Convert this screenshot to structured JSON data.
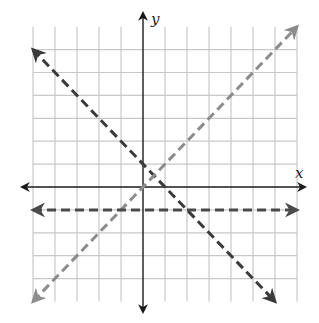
{
  "canvas": {
    "width": 319,
    "height": 323,
    "background": "#ffffff"
  },
  "frame": {
    "origin_px": [
      143,
      187
    ],
    "unit_x_px": 22.0,
    "unit_y_px": 22.9
  },
  "grid": {
    "x_min": -5,
    "x_max": 7,
    "y_min": -5,
    "y_max": 7,
    "vertical_lines_at": [
      -5,
      -4,
      -3,
      -2,
      -1,
      1,
      2,
      3,
      4,
      5,
      6,
      7
    ],
    "horizontal_lines_at": [
      -4,
      -3,
      -2,
      -1,
      1,
      2,
      3,
      4,
      5,
      6
    ],
    "color": "#c8c8c8",
    "width": 1.2
  },
  "axes": {
    "color": "#1a1a1a",
    "x_axis": {
      "from_px": 22,
      "to_px": 305,
      "label": "x"
    },
    "y_axis": {
      "from_px": 13,
      "to_px": 312,
      "label": "y"
    }
  },
  "lines": [
    {
      "name": "line-y-equals-negative-x-plus-1",
      "equation": "y = -x + 1",
      "from": [
        -5,
        6
      ],
      "to": [
        6,
        -5
      ],
      "color": "#3a3a3a",
      "style": "dashed",
      "arrows": "both"
    },
    {
      "name": "line-y-equals-x",
      "equation": "y = x",
      "from": [
        -5,
        -5
      ],
      "to": [
        7,
        7
      ],
      "color": "#8c8c8c",
      "style": "dashed",
      "arrows": "both"
    },
    {
      "name": "line-y-equals-negative-1",
      "equation": "y = -1",
      "from": [
        -5,
        -1
      ],
      "to": [
        7,
        -1
      ],
      "color": "#4a4a4a",
      "style": "dashed",
      "arrows": "both"
    }
  ],
  "labels": {
    "x_axis_label": "x",
    "y_axis_label": "y"
  }
}
